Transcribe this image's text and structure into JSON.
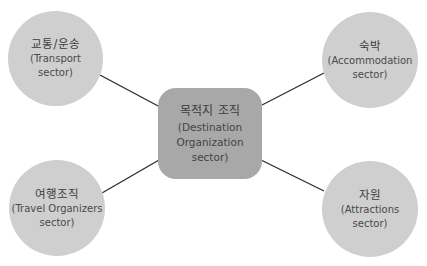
{
  "diagram": {
    "center": {
      "title": "목적지 조직",
      "lines": [
        "(Destination",
        "Organization",
        "sector)"
      ]
    },
    "nodes": {
      "top_left": {
        "title": "교통/운송",
        "lines": [
          "(Transport",
          "sector)"
        ]
      },
      "top_right": {
        "title": "숙박",
        "lines": [
          "(Accommodation",
          "sector)"
        ]
      },
      "bottom_left": {
        "title": "여행조직",
        "lines": [
          "(Travel Organizers",
          "sector)"
        ]
      },
      "bottom_right": {
        "title": "자원",
        "lines": [
          "(Attractions",
          "sector)"
        ]
      }
    },
    "colors": {
      "circle_fill": "#cfcfcf",
      "center_fill": "#a8a8a8",
      "connector": "#2b2b2b",
      "text": "#3d3d3d"
    }
  }
}
